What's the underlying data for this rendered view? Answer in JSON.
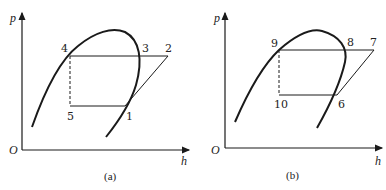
{
  "panels": [
    {
      "id": "a",
      "caption": "(a)",
      "axis": {
        "y_label": "p",
        "x_label": "h",
        "origin_label": "O"
      },
      "points": {
        "p1": "1",
        "p2": "2",
        "p3": "3",
        "p4": "4",
        "p5": "5"
      }
    },
    {
      "id": "b",
      "caption": "(b)",
      "axis": {
        "y_label": "p",
        "x_label": "h",
        "origin_label": "O"
      },
      "points": {
        "p6": "6",
        "p7": "7",
        "p8": "8",
        "p9": "9",
        "p10": "10"
      }
    }
  ],
  "colors": {
    "line": "#1a1a1a"
  }
}
